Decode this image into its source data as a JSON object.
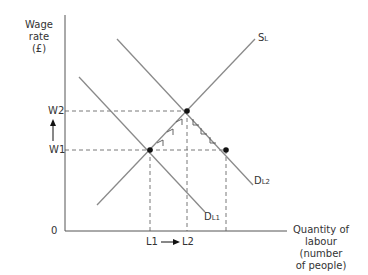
{
  "diagram": {
    "y_axis_label_line1": "Wage rate",
    "y_axis_label_line2": "(£)",
    "x_axis_label_line1": "Quantity of",
    "x_axis_label_line2": "labour (number",
    "x_axis_label_line3": "of people)",
    "origin": "0",
    "w2": "W2",
    "w1": "W1",
    "l1": "L1",
    "l2": "L2",
    "supply_label": "S",
    "supply_sub": "L",
    "d1_label": "D",
    "d1_sub": "L1",
    "d2_label": "D",
    "d2_sub": "L2",
    "colors": {
      "line": "#8a8a8a",
      "axis": "#555555",
      "point": "#111111"
    }
  }
}
